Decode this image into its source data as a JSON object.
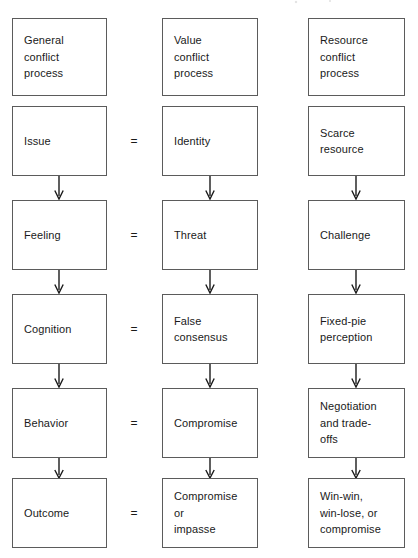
{
  "diagram": {
    "type": "flowchart-matrix",
    "columns": [
      {
        "id": "general",
        "header": [
          "General",
          "conflict",
          "process"
        ]
      },
      {
        "id": "value",
        "header": [
          "Value",
          "conflict",
          "process"
        ]
      },
      {
        "id": "resource",
        "header": [
          "Resource",
          "conflict",
          "process"
        ]
      }
    ],
    "equals_symbol": "=",
    "rows": [
      {
        "id": "issue",
        "general": [
          "Issue"
        ],
        "value": [
          "Identity"
        ],
        "resource": [
          "Scarce",
          "resource"
        ],
        "equals": "="
      },
      {
        "id": "feeling",
        "general": [
          "Feeling"
        ],
        "value": [
          "Threat"
        ],
        "resource": [
          "Challenge"
        ],
        "equals": "="
      },
      {
        "id": "cognition",
        "general": [
          "Cognition"
        ],
        "value": [
          "False",
          "consensus"
        ],
        "resource": [
          "Fixed-pie",
          "perception"
        ],
        "equals": "="
      },
      {
        "id": "behavior",
        "general": [
          "Behavior"
        ],
        "value": [
          "Compromise"
        ],
        "resource": [
          "Negotiation",
          "and trade-",
          "offs"
        ],
        "equals": "="
      },
      {
        "id": "outcome",
        "general": [
          "Outcome"
        ],
        "value": [
          "Compromise",
          "or",
          "impasse"
        ],
        "resource": [
          "Win-win,",
          "win-lose, or",
          "compromise"
        ],
        "equals": "="
      }
    ],
    "colors": {
      "box_border": "#5b5b5b",
      "text": "#1a1a1a",
      "arrow": "#1a1a1a",
      "background": "#ffffff"
    }
  }
}
